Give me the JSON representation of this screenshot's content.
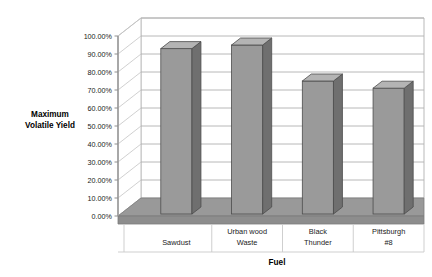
{
  "chart_data": {
    "type": "bar",
    "title": "",
    "xlabel": "Fuel",
    "ylabel": "Maximum Volatile Yield",
    "ylabel_line1": "Maximum",
    "ylabel_line2": "Volatile Yield",
    "categories": [
      "Sawdust",
      "Urban wood Waste",
      "Black Thunder",
      "Pittsburgh #8"
    ],
    "category_lines": [
      [
        "Sawdust"
      ],
      [
        "Urban wood",
        "Waste"
      ],
      [
        "Black",
        "Thunder"
      ],
      [
        "Pittsburgh",
        "#8"
      ]
    ],
    "values": [
      0.93,
      0.95,
      0.75,
      0.71
    ],
    "value_labels": [
      "93.00%",
      "95.00%",
      "75.00%",
      "71.00%"
    ],
    "ylim": [
      0,
      1
    ],
    "ytick_values": [
      0,
      0.1,
      0.2,
      0.3,
      0.4,
      0.5,
      0.6,
      0.7,
      0.8,
      0.9,
      1.0
    ],
    "ytick_labels": [
      "0.00%",
      "10.00%",
      "20.00%",
      "30.00%",
      "40.00%",
      "50.00%",
      "60.00%",
      "70.00%",
      "80.00%",
      "90.00%",
      "100.00%"
    ],
    "grid": true,
    "legend": false,
    "legend_position": "none",
    "style": "3d-column",
    "colors": {
      "bar_front": "#9a9a9a",
      "bar_side": "#6f6f6f",
      "bar_top": "#b4b4b4",
      "bar_outline": "#4d4d4d",
      "floor": "#999999",
      "floor_outline": "#7a7a7a",
      "gridline": "#b0b0b0",
      "axis": "#9a9a9a",
      "background": "#ffffff"
    }
  }
}
